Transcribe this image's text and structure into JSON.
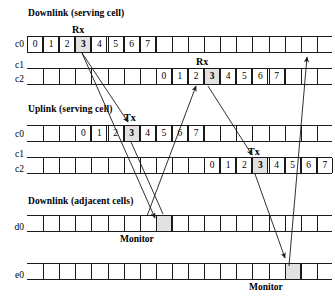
{
  "figure": {
    "groups": [
      {
        "key": "downlink_serving",
        "title": "Downlink (serving cell)",
        "rows": [
          {
            "label": "c0"
          },
          {
            "label": "c1"
          },
          {
            "label": "c2"
          }
        ]
      },
      {
        "key": "uplink_serving",
        "title": "Uplink (serving cell)",
        "rows": [
          {
            "label": "c0"
          },
          {
            "label": "c1"
          },
          {
            "label": "c2"
          }
        ]
      },
      {
        "key": "downlink_adjacent",
        "title": "Downlink (adjacent cells)",
        "rows": [
          {
            "label": "d0"
          },
          {
            "label": "e0"
          }
        ]
      }
    ],
    "timeslot_numbers": [
      "0",
      "1",
      "2",
      "3",
      "4",
      "5",
      "6",
      "7"
    ],
    "highlighted_timeslot": "3",
    "annotations": [
      {
        "key": "rx_c0",
        "text": "Rx"
      },
      {
        "key": "rx_c2",
        "text": "Rx"
      },
      {
        "key": "tx_c0",
        "text": "Tx"
      },
      {
        "key": "tx_c2",
        "text": "Tx"
      },
      {
        "key": "monitor_d0",
        "text": "Monitor"
      },
      {
        "key": "monitor_e0",
        "text": "Monitor"
      }
    ],
    "bursts": [
      {
        "key": "dl_c0",
        "group": "downlink_serving",
        "row": "c0",
        "label": "Rx",
        "slots": [
          "0",
          "1",
          "2",
          "3",
          "4",
          "5",
          "6",
          "7"
        ],
        "highlight": "3"
      },
      {
        "key": "dl_c2",
        "group": "downlink_serving",
        "row": "c2",
        "label": "Rx",
        "slots": [
          "0",
          "1",
          "2",
          "3",
          "4",
          "5",
          "6",
          "7"
        ],
        "highlight": "3"
      },
      {
        "key": "ul_c0",
        "group": "uplink_serving",
        "row": "c0",
        "label": "Tx",
        "slots": [
          "0",
          "1",
          "2",
          "3",
          "4",
          "5",
          "6",
          "7"
        ],
        "highlight": "3"
      },
      {
        "key": "ul_c2",
        "group": "uplink_serving",
        "row": "c2",
        "label": "Tx",
        "slots": [
          "0",
          "1",
          "2",
          "3",
          "4",
          "5",
          "6",
          "7"
        ],
        "highlight": "3"
      }
    ],
    "monitor_slots": [
      {
        "key": "mon_d0",
        "row": "d0",
        "label": "Monitor"
      },
      {
        "key": "mon_e0",
        "row": "e0",
        "label": "Monitor"
      }
    ],
    "colors": {
      "line": "#1a1a1a",
      "highlight_fill": "#e2e2e2",
      "background": "#ffffff"
    }
  }
}
